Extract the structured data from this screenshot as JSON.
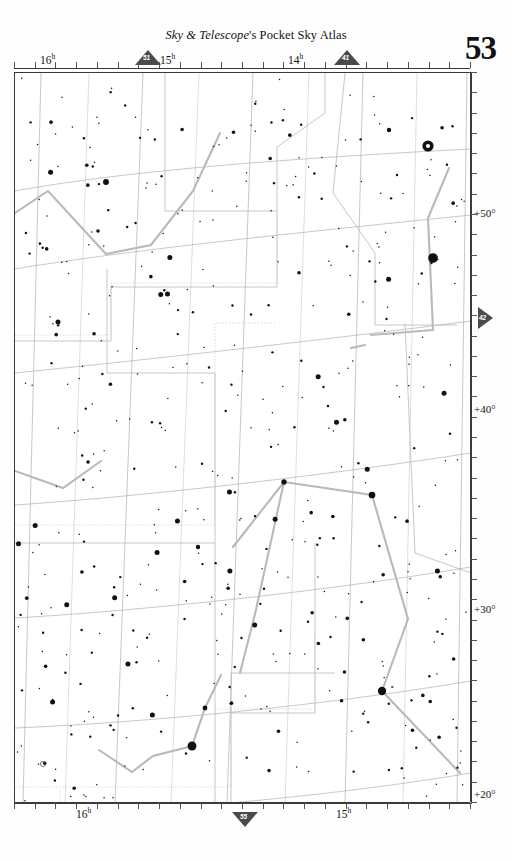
{
  "header": {
    "publisher_italic": "Sky & Telescope",
    "publisher_rest": "'s Pocket Sky Atlas",
    "page_number": "53"
  },
  "nav_markers": [
    {
      "name": "nav-chart-51",
      "label": "51",
      "dir": "up",
      "x": 135,
      "y": 50
    },
    {
      "name": "nav-chart-41",
      "label": "41",
      "dir": "up",
      "x": 334,
      "y": 50
    },
    {
      "name": "nav-chart-42",
      "label": "42",
      "dir": "right",
      "x": 478,
      "y": 307
    },
    {
      "name": "nav-chart-55",
      "label": "55",
      "dir": "down",
      "x": 232,
      "y": 812
    }
  ],
  "axes": {
    "ra_top": [
      {
        "label": "16",
        "unit": "h",
        "x": 40
      },
      {
        "label": "15",
        "unit": "h",
        "x": 160
      },
      {
        "label": "14",
        "unit": "h",
        "x": 288
      }
    ],
    "ra_bottom": [
      {
        "label": "16",
        "unit": "h",
        "x": 76
      },
      {
        "label": "15",
        "unit": "h",
        "x": 336
      }
    ],
    "dec_right": [
      {
        "label": "+50°",
        "y": 214
      },
      {
        "label": "+40°",
        "y": 410
      },
      {
        "label": "+30°",
        "y": 610
      },
      {
        "label": "+20°",
        "y": 795
      }
    ]
  },
  "chart_data": {
    "type": "scatter",
    "xlabel": "Right Ascension (h)",
    "ylabel": "Declination (deg)",
    "xlim": [
      16.3,
      13.6
    ],
    "ylim": [
      18,
      56
    ],
    "grid": true,
    "constellations": [
      {
        "name": "DRACO",
        "x": 88,
        "y": 143,
        "size": "large"
      },
      {
        "name": "URSA MAJOR",
        "x": 283,
        "y": 142,
        "size": "large"
      },
      {
        "name": "CANES",
        "x": 428,
        "y": 343,
        "size": "small"
      },
      {
        "name": "VENATICI",
        "x": 428,
        "y": 357,
        "size": "small"
      },
      {
        "name": "HERCULES",
        "x": 20,
        "y": 491,
        "size": "large"
      },
      {
        "name": "BOOTES",
        "x": 303,
        "y": 573,
        "size": "large"
      },
      {
        "name": "CORONA BOREALIS",
        "x": 44,
        "y": 686,
        "size": "large"
      },
      {
        "name": "SERPENS CAPUT",
        "x": 93,
        "y": 805,
        "size": "large"
      }
    ],
    "named_stars": [
      {
        "name": "Edasich",
        "x": 105,
        "y": 181,
        "mag": 3.3,
        "sx": 136,
        "sy": 172
      },
      {
        "name": "Mizar",
        "x": 427,
        "y": 145,
        "mag": 2.2,
        "sx": 417,
        "sy": 140
      },
      {
        "name": "Alcor",
        "x": 388,
        "y": 129,
        "mag": 4.0,
        "sx": 417,
        "sy": 136
      },
      {
        "name": "Alkaid",
        "x": 432,
        "y": 257,
        "mag": 1.9,
        "sx": 421,
        "sy": 254
      },
      {
        "name": "Nekkar",
        "x": 283,
        "y": 481,
        "mag": 3.5,
        "sx": 272,
        "sy": 484
      },
      {
        "name": "Seginus",
        "x": 371,
        "y": 494,
        "mag": 3.0,
        "sx": 359,
        "sy": 494
      },
      {
        "name": "Alkalurops",
        "x": 197,
        "y": 546,
        "mag": 4.3,
        "sx": 189,
        "sy": 554
      },
      {
        "name": "Izar",
        "x": 381,
        "y": 690,
        "mag": 2.4,
        "sx": 369,
        "sy": 699
      },
      {
        "name": "Nusakan",
        "x": 204,
        "y": 707,
        "mag": 3.7,
        "sx": 196,
        "sy": 705
      },
      {
        "name": "Alphecca",
        "x": 191,
        "y": 745,
        "mag": 2.2,
        "sx": 179,
        "sy": 745
      },
      {
        "name": "T = Blaze Star",
        "x": 42,
        "y": 763,
        "mag": 10.0,
        "sx": 80,
        "sy": 765
      }
    ],
    "greek_labels": [
      {
        "label": "θ",
        "x": 47,
        "y": 190
      },
      {
        "label": "ι",
        "x": 147,
        "y": 175
      },
      {
        "label": "κ",
        "x": 367,
        "y": 240
      },
      {
        "label": "θ",
        "x": 296,
        "y": 256
      },
      {
        "label": "ι",
        "x": 320,
        "y": 265
      },
      {
        "label": "η",
        "x": 403,
        "y": 261
      },
      {
        "label": "λ",
        "x": 350,
        "y": 347
      },
      {
        "label": "τ",
        "x": 11,
        "y": 404
      },
      {
        "label": "υ",
        "x": 49,
        "y": 409
      },
      {
        "label": "ϕ",
        "x": 40,
        "y": 431
      },
      {
        "label": "χ",
        "x": 93,
        "y": 480
      },
      {
        "label": "ν²",
        "x": 155,
        "y": 481
      },
      {
        "label": "ν¹",
        "x": 173,
        "y": 486
      },
      {
        "label": "φ",
        "x": 136,
        "y": 499
      },
      {
        "label": "μ",
        "x": 154,
        "y": 519
      },
      {
        "label": "λ",
        "x": 90,
        "y": 545
      },
      {
        "label": "μ",
        "x": 183,
        "y": 563
      },
      {
        "label": "ζ",
        "x": 148,
        "y": 569
      },
      {
        "label": "τ",
        "x": 46,
        "y": 576
      },
      {
        "label": "κ",
        "x": 108,
        "y": 600
      },
      {
        "label": "σ",
        "x": 27,
        "y": 627
      },
      {
        "label": "ρ",
        "x": 68,
        "y": 635
      },
      {
        "label": "π",
        "x": 139,
        "y": 643
      },
      {
        "label": "θ",
        "x": 180,
        "y": 657
      },
      {
        "label": "β",
        "x": 272,
        "y": 484
      },
      {
        "label": "γ",
        "x": 357,
        "y": 508
      },
      {
        "label": "δ",
        "x": 239,
        "y": 613
      },
      {
        "label": "η",
        "x": 219,
        "y": 674
      },
      {
        "label": "ο",
        "x": 239,
        "y": 688
      },
      {
        "label": "χ",
        "x": 259,
        "y": 690
      },
      {
        "label": "β",
        "x": 196,
        "y": 705
      },
      {
        "label": "ι",
        "x": 62,
        "y": 680
      },
      {
        "label": "υ",
        "x": 20,
        "y": 712
      },
      {
        "label": "ε",
        "x": 98,
        "y": 749
      },
      {
        "label": "γ",
        "x": 152,
        "y": 755
      },
      {
        "label": "δ",
        "x": 131,
        "y": 771
      },
      {
        "label": "α",
        "x": 190,
        "y": 758
      },
      {
        "label": "ψ",
        "x": 293,
        "y": 718
      },
      {
        "label": "ω",
        "x": 317,
        "y": 748
      },
      {
        "label": "ε",
        "x": 369,
        "y": 699
      },
      {
        "label": "ρ",
        "x": 407,
        "y": 618
      },
      {
        "label": "σ",
        "x": 399,
        "y": 650
      },
      {
        "label": "ρ",
        "x": 7,
        "y": 402
      },
      {
        "label": "ζ",
        "x": 428,
        "y": 117
      }
    ],
    "deep_sky_objects": [
      {
        "id": "6015",
        "x": 65,
        "y": 126
      },
      {
        "id": "5982",
        "x": 104,
        "y": 162
      },
      {
        "id": "5985",
        "x": 72,
        "y": 175
      },
      {
        "id": "5879",
        "x": 146,
        "y": 203
      },
      {
        "id": "5907",
        "x": 138,
        "y": 217
      },
      {
        "id": "5866",
        "x": 172,
        "y": 225
      },
      {
        "id": "5322",
        "x": 305,
        "y": 87
      },
      {
        "id": "5204",
        "x": 383,
        "y": 86
      },
      {
        "id": "5678",
        "x": 232,
        "y": 157
      },
      {
        "id": "5585",
        "x": 263,
        "y": 162
      },
      {
        "id": "5631",
        "x": 270,
        "y": 177
      },
      {
        "id": "5473",
        "x": 312,
        "y": 180
      },
      {
        "id": "M101",
        "x": 345,
        "y": 186
      },
      {
        "id": "5474",
        "x": 345,
        "y": 200
      },
      {
        "id": "5448",
        "x": 370,
        "y": 271
      },
      {
        "id": "5377",
        "x": 411,
        "y": 296
      },
      {
        "id": "IC 1029",
        "x": 274,
        "y": 292
      },
      {
        "id": "5676",
        "x": 297,
        "y": 308
      },
      {
        "id": "5689",
        "x": 266,
        "y": 321
      },
      {
        "id": "5383",
        "x": 420,
        "y": 385
      },
      {
        "id": "5371",
        "x": 428,
        "y": 405
      },
      {
        "id": "5557",
        "x": 418,
        "y": 503
      },
      {
        "id": "Σ1834",
        "x": 322,
        "y": 284
      },
      {
        "id": "OΣ 298",
        "x": 140,
        "y": 511
      },
      {
        "id": "Σ1932",
        "x": 219,
        "y": 728
      }
    ],
    "variable_stars": [
      {
        "id": "TW",
        "x": 85,
        "y": 89
      },
      {
        "id": "BV",
        "x": 155,
        "y": 108
      },
      {
        "id": "AT",
        "x": 13,
        "y": 176
      },
      {
        "id": "FG",
        "x": 182,
        "y": 320
      },
      {
        "id": "ST",
        "x": 75,
        "y": 360
      },
      {
        "id": "X",
        "x": 47,
        "y": 386
      },
      {
        "id": "RR",
        "x": 138,
        "y": 537
      },
      {
        "id": "V(c)",
        "x": 96,
        "y": 524
      },
      {
        "id": "RV",
        "x": 338,
        "y": 594
      },
      {
        "id": "RW",
        "x": 338,
        "y": 621
      },
      {
        "id": "R",
        "x": 128,
        "y": 729
      },
      {
        "id": "RU",
        "x": 41,
        "y": 795
      },
      {
        "id": "W",
        "x": 382,
        "y": 714
      },
      {
        "id": "R",
        "x": 396,
        "y": 701
      },
      {
        "id": "S",
        "x": 212,
        "y": 660
      },
      {
        "id": "RX",
        "x": 451,
        "y": 707
      },
      {
        "id": "A",
        "x": 428,
        "y": 523
      },
      {
        "id": "V",
        "x": 390,
        "y": 474
      }
    ],
    "flamsteed_numbers": [
      {
        "id": "78",
        "x": 447,
        "y": 95
      },
      {
        "id": "80",
        "x": 404,
        "y": 145
      },
      {
        "id": "83",
        "x": 393,
        "y": 158
      },
      {
        "id": "82",
        "x": 411,
        "y": 180
      },
      {
        "id": "24",
        "x": 451,
        "y": 238
      },
      {
        "id": "13",
        "x": 350,
        "y": 275
      },
      {
        "id": "33",
        "x": 312,
        "y": 390
      },
      {
        "id": "44 = i",
        "x": 209,
        "y": 369
      },
      {
        "id": "14",
        "x": 22,
        "y": 450
      },
      {
        "id": "2",
        "x": 88,
        "y": 460
      },
      {
        "id": "50",
        "x": 204,
        "y": 626
      },
      {
        "id": "45",
        "x": 297,
        "y": 763
      }
    ]
  }
}
